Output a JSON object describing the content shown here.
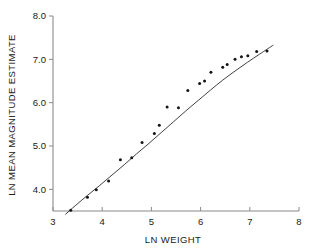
{
  "chart_data": {
    "type": "scatter",
    "title": "",
    "xlabel": "LN WEIGHT",
    "ylabel": "LN MEAN MAGNITUDE ESTIMATE",
    "xlim": [
      3,
      8
    ],
    "ylim": [
      3.5,
      8.0
    ],
    "grid": false,
    "legend": null,
    "xticks": [
      3,
      4,
      5,
      6,
      7,
      8
    ],
    "xtick_labels": [
      "3",
      "4",
      "5",
      "6",
      "7",
      "8"
    ],
    "yticks": [
      4.0,
      5.0,
      6.0,
      7.0,
      8.0
    ],
    "ytick_labels": [
      "4.0",
      "5.0",
      "6.0",
      "7.0",
      "8.0"
    ],
    "points": [
      {
        "x": 3.36,
        "y": 3.52
      },
      {
        "x": 3.7,
        "y": 3.82
      },
      {
        "x": 3.88,
        "y": 3.99
      },
      {
        "x": 4.13,
        "y": 4.19
      },
      {
        "x": 4.37,
        "y": 4.68
      },
      {
        "x": 4.6,
        "y": 4.73
      },
      {
        "x": 4.81,
        "y": 5.08
      },
      {
        "x": 5.06,
        "y": 5.29
      },
      {
        "x": 5.16,
        "y": 5.48
      },
      {
        "x": 5.32,
        "y": 5.9
      },
      {
        "x": 5.55,
        "y": 5.88
      },
      {
        "x": 5.74,
        "y": 6.28
      },
      {
        "x": 5.98,
        "y": 6.44
      },
      {
        "x": 6.08,
        "y": 6.5
      },
      {
        "x": 6.21,
        "y": 6.7
      },
      {
        "x": 6.45,
        "y": 6.82
      },
      {
        "x": 6.54,
        "y": 6.88
      },
      {
        "x": 6.7,
        "y": 7.0
      },
      {
        "x": 6.83,
        "y": 7.06
      },
      {
        "x": 6.96,
        "y": 7.08
      },
      {
        "x": 7.14,
        "y": 7.18
      },
      {
        "x": 7.35,
        "y": 7.19
      }
    ],
    "fit_curve": {
      "description": "fitted concave curve through scatter",
      "x_start": 3.25,
      "x_end": 7.48,
      "points": [
        {
          "x": 3.25,
          "y": 3.42
        },
        {
          "x": 3.45,
          "y": 3.62
        },
        {
          "x": 3.7,
          "y": 3.86
        },
        {
          "x": 3.95,
          "y": 4.09
        },
        {
          "x": 4.2,
          "y": 4.33
        },
        {
          "x": 4.45,
          "y": 4.57
        },
        {
          "x": 4.7,
          "y": 4.82
        },
        {
          "x": 4.95,
          "y": 5.06
        },
        {
          "x": 5.2,
          "y": 5.31
        },
        {
          "x": 5.45,
          "y": 5.56
        },
        {
          "x": 5.7,
          "y": 5.81
        },
        {
          "x": 5.95,
          "y": 6.05
        },
        {
          "x": 6.2,
          "y": 6.29
        },
        {
          "x": 6.45,
          "y": 6.52
        },
        {
          "x": 6.7,
          "y": 6.73
        },
        {
          "x": 6.95,
          "y": 6.93
        },
        {
          "x": 7.2,
          "y": 7.12
        },
        {
          "x": 7.48,
          "y": 7.33
        }
      ]
    }
  }
}
